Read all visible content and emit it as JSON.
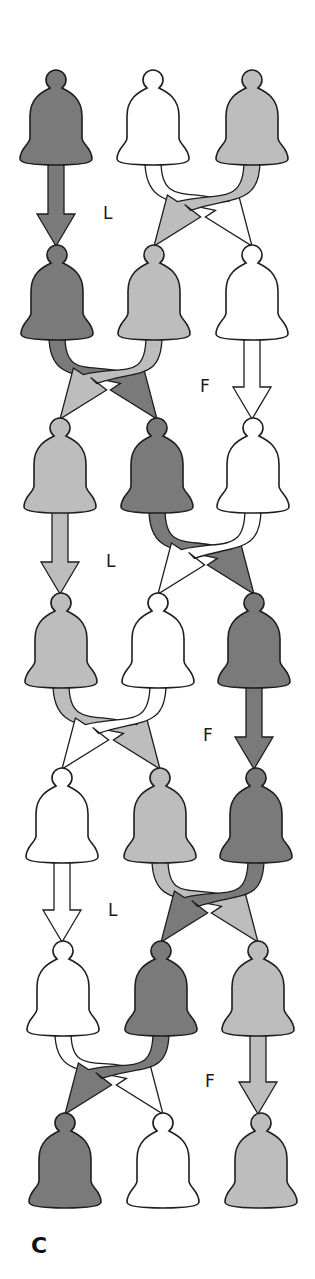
{
  "colors": {
    "dark": "#7a7a7a",
    "light": "#bdbdbd",
    "white": "#ffffff",
    "stroke": "#1e1e1e"
  },
  "rows": [
    {
      "y": 70,
      "xs": [
        56,
        153,
        252
      ],
      "order": [
        "dark",
        "white",
        "light"
      ]
    },
    {
      "y": 245,
      "xs": [
        57,
        154,
        252
      ],
      "order": [
        "dark",
        "light",
        "white"
      ]
    },
    {
      "y": 418,
      "xs": [
        60,
        157,
        253
      ],
      "order": [
        "light",
        "dark",
        "white"
      ]
    },
    {
      "y": 593,
      "xs": [
        61,
        158,
        254
      ],
      "order": [
        "light",
        "white",
        "dark"
      ]
    },
    {
      "y": 768,
      "xs": [
        62,
        160,
        256
      ],
      "order": [
        "white",
        "light",
        "dark"
      ]
    },
    {
      "y": 941,
      "xs": [
        63,
        161,
        258
      ],
      "order": [
        "white",
        "dark",
        "light"
      ]
    },
    {
      "y": 1113,
      "xs": [
        65,
        163,
        261
      ],
      "order": [
        "dark",
        "white",
        "light"
      ]
    }
  ],
  "transitions": [
    {
      "label": "L",
      "swap": [
        1,
        2
      ],
      "label_x": 103,
      "label_y": 205
    },
    {
      "label": "F",
      "swap": [
        0,
        1
      ],
      "label_x": 200,
      "label_y": 378
    },
    {
      "label": "L",
      "swap": [
        1,
        2
      ],
      "label_x": 106,
      "label_y": 553
    },
    {
      "label": "F",
      "swap": [
        0,
        1
      ],
      "label_x": 203,
      "label_y": 727
    },
    {
      "label": "L",
      "swap": [
        1,
        2
      ],
      "label_x": 108,
      "label_y": 902
    },
    {
      "label": "F",
      "swap": [
        0,
        1
      ],
      "label_x": 205,
      "label_y": 1073
    }
  ],
  "caption": {
    "text": "C",
    "x": 31,
    "y": 1235
  }
}
